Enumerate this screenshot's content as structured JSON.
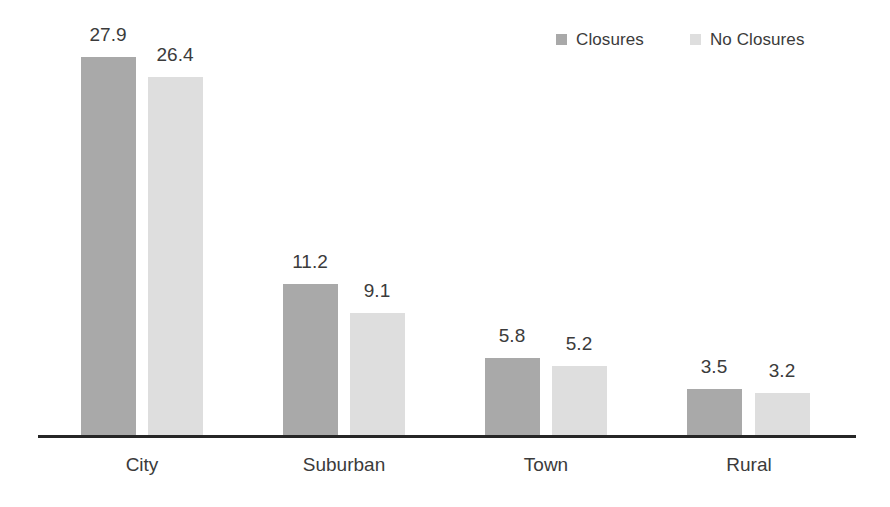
{
  "chart_data": {
    "type": "bar",
    "title": "",
    "subtitle": "",
    "xlabel": "",
    "ylabel": "",
    "categories": [
      "City",
      "Suburban",
      "Town",
      "Rural"
    ],
    "series": [
      {
        "name": "Closures",
        "color": "#a9a9a9",
        "values": [
          27.9,
          11.2,
          5.8,
          3.5
        ]
      },
      {
        "name": "No Closures",
        "color": "#dedede",
        "values": [
          26.4,
          9.1,
          5.2,
          3.2
        ]
      }
    ],
    "value_labels": [
      [
        "27.9",
        "26.4"
      ],
      [
        "11.2",
        "9.1"
      ],
      [
        "5.8",
        "5.2"
      ],
      [
        "3.5",
        "3.2"
      ]
    ],
    "ylim": [
      0,
      30
    ],
    "grid": false,
    "legend_position": "top-right",
    "axis_line_color": "#262626",
    "text_color": "#3b3b3b",
    "background": "#ffffff"
  },
  "legend": {
    "items": [
      {
        "label": "Closures",
        "color": "#a9a9a9",
        "swatch_name": "legend-swatch-closures"
      },
      {
        "label": "No Closures",
        "color": "#dedede",
        "swatch_name": "legend-swatch-no-closures"
      }
    ]
  }
}
